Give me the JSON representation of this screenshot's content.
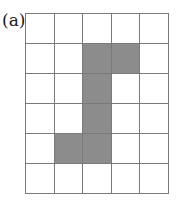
{
  "figure": {
    "label": "(a)",
    "grid": {
      "columns": 5,
      "rows": 6
    },
    "shaded_cells": [
      [
        1,
        2
      ],
      [
        1,
        3
      ],
      [
        2,
        2
      ],
      [
        3,
        2
      ],
      [
        4,
        1
      ],
      [
        4,
        2
      ]
    ],
    "colors": {
      "shade": "#8c8c8c",
      "line": "#7a7a7a",
      "background": "#ffffff"
    }
  }
}
